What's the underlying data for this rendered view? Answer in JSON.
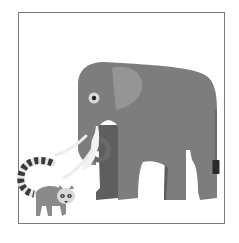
{
  "illustration": {
    "subjects": [
      "elephant",
      "ring-tailed lemur"
    ],
    "colors": {
      "frame": "#7a7a7a",
      "background": "#ffffff",
      "elephant_body": "#7d7d7d",
      "elephant_ear": "#959595",
      "elephant_far_legs": "#5e5e5e",
      "tusk": "#f2f2f2",
      "eye_ring": "#d8d8d8",
      "eye_pupil": "#222222",
      "tail_tuft": "#2a2a2a",
      "lemur_body": "#8a8a8a",
      "lemur_face": "#d9d9d9",
      "lemur_tail_dark": "#3a3a3a",
      "lemur_tail_light": "#e6e6e6"
    }
  }
}
